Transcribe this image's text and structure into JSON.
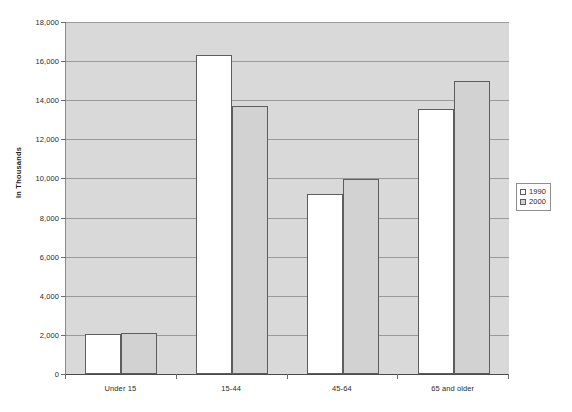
{
  "title_remnant": "·        ·",
  "chart_data": {
    "type": "bar",
    "title": "",
    "xlabel": "",
    "ylabel": "In Thousands",
    "categories": [
      "Under 15",
      "15-44",
      "45-64",
      "65 and older"
    ],
    "series": [
      {
        "name": "1990",
        "color": "#ffffff",
        "values": [
          2050,
          16300,
          9200,
          13550
        ]
      },
      {
        "name": "2000",
        "color": "#d2d2d2",
        "values": [
          2080,
          13700,
          9950,
          15000
        ]
      }
    ],
    "ylim": [
      0,
      18000
    ],
    "ytick_step": 2000,
    "ytick_labels": [
      "0",
      "2,000",
      "4,000",
      "6,000",
      "8,000",
      "10,000",
      "12,000",
      "14,000",
      "16,000",
      "18,000"
    ],
    "grid": true,
    "legend_position": "right",
    "plot_background": "#d9d9d9",
    "gridline_color": "#9a9a9a",
    "bar_border_color": "#5d5d5d"
  }
}
